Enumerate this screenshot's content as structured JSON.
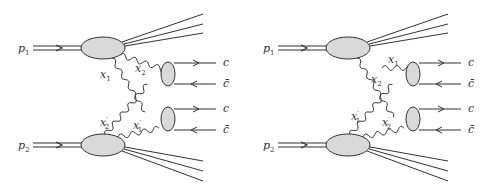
{
  "diagrams": [
    {
      "id": "left",
      "incoming": [
        "p1",
        "p2"
      ],
      "gluon_labels": {
        "top_a": "x1",
        "top_b": "x2",
        "bot_a": "x2'",
        "bot_b": "x1'"
      },
      "outgoing": [
        "c",
        "c̄",
        "c",
        "c̄"
      ]
    },
    {
      "id": "right",
      "incoming": [
        "p1",
        "p2"
      ],
      "gluon_labels": {
        "top_a": "x1",
        "top_b": "x2",
        "bot_a": "x1'",
        "bot_b": "x2'"
      },
      "outgoing": [
        "c",
        "c̄",
        "c",
        "c̄"
      ]
    }
  ],
  "labels": {
    "p": "p",
    "one": "1",
    "two": "2",
    "x": "x",
    "prime": "′",
    "c": "c",
    "cbar": "c̄"
  },
  "colors": {
    "blob_fill": "#d9d9d9",
    "line": "#333333"
  }
}
